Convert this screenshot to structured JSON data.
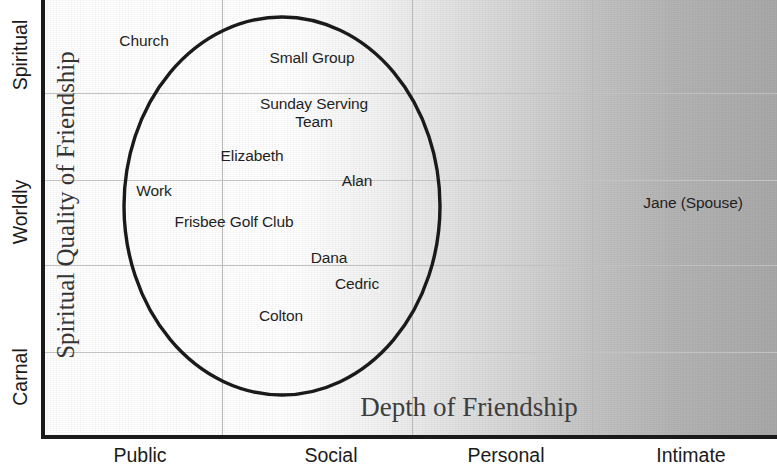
{
  "chart_data": {
    "type": "scatter",
    "title": "",
    "xlabel": "Depth of Friendship",
    "ylabel": "Spiritual Quality of Friendship",
    "x_tick_labels": [
      "Public",
      "Social",
      "Personal",
      "Intimate"
    ],
    "y_tick_labels": [
      "Spiritual",
      "Worldly",
      "Carnal"
    ],
    "grid": true,
    "legend": "none",
    "xlim": [
      0,
      4
    ],
    "ylim": [
      0,
      3
    ],
    "background": {
      "gradient_from": "#ffffff",
      "gradient_to": "#a9a9a9",
      "direction": "left-to-right"
    },
    "annotations": {
      "ellipse": {
        "label": "circle-of-friendship",
        "center_x": 1.33,
        "center_y": 1.58,
        "radius_x": 0.83,
        "radius_y": 1.3,
        "stroke": "#1a1a1a"
      }
    },
    "points": [
      {
        "label": "Church",
        "x": 0.48,
        "y": 2.73,
        "inside_circle": false
      },
      {
        "label": "Small Group",
        "x": 1.38,
        "y": 2.6,
        "inside_circle": true
      },
      {
        "label": "Sunday Serving\nTeam",
        "x": 1.33,
        "y": 2.28,
        "inside_circle": true
      },
      {
        "label": "Elizabeth",
        "x": 1.07,
        "y": 1.92,
        "inside_circle": true
      },
      {
        "label": "Alan",
        "x": 1.71,
        "y": 1.77,
        "inside_circle": true
      },
      {
        "label": "Work",
        "x": 0.59,
        "y": 1.68,
        "inside_circle": true
      },
      {
        "label": "Frisbee Golf Club",
        "x": 1.0,
        "y": 1.47,
        "inside_circle": true
      },
      {
        "label": "Dana",
        "x": 1.5,
        "y": 1.18,
        "inside_circle": true
      },
      {
        "label": "Cedric",
        "x": 1.65,
        "y": 0.99,
        "inside_circle": true
      },
      {
        "label": "Colton",
        "x": 1.23,
        "y": 0.8,
        "inside_circle": true
      },
      {
        "label": "Jane (Spouse)",
        "x": 3.46,
        "y": 1.73,
        "inside_circle": false
      }
    ],
    "gridlines": {
      "vertical_x": [
        1.0,
        2.0,
        3.0
      ],
      "horizontal_y": [
        2.4,
        1.78,
        1.18,
        0.55
      ]
    }
  },
  "labels": {
    "nodes": [
      {
        "text": "Church",
        "px": 100,
        "py": 41
      },
      {
        "text": "Small Group",
        "px": 268,
        "py": 58
      },
      {
        "text": "Sunday Serving\nTeam",
        "px": 270,
        "py": 113
      },
      {
        "text": "Elizabeth",
        "px": 208,
        "py": 156
      },
      {
        "text": "Alan",
        "px": 313,
        "py": 181
      },
      {
        "text": "Work",
        "px": 110,
        "py": 191
      },
      {
        "text": "Frisbee Golf Club",
        "px": 190,
        "py": 222
      },
      {
        "text": "Dana",
        "px": 285,
        "py": 258
      },
      {
        "text": "Cedric",
        "px": 313,
        "py": 284
      },
      {
        "text": "Colton",
        "px": 237,
        "py": 316
      },
      {
        "text": "Jane (Spouse)",
        "px": 649,
        "py": 203
      }
    ],
    "x_ticks": [
      {
        "text": "Public",
        "px": 140
      },
      {
        "text": "Social",
        "px": 331
      },
      {
        "text": "Personal",
        "px": 506
      },
      {
        "text": "Intimate",
        "px": 691
      }
    ],
    "y_ticks": [
      {
        "text": "Spiritual",
        "py": 55
      },
      {
        "text": "Worldly",
        "py": 212
      },
      {
        "text": "Carnal",
        "py": 377
      }
    ],
    "y_axis_title": "Spiritual Quality of Friendship",
    "x_axis_title": "Depth of Friendship"
  },
  "geometry": {
    "gridlines_v_px": [
      178,
      368,
      548
    ],
    "gridlines_h_px": [
      93,
      180,
      265,
      352
    ],
    "ellipse": {
      "cx": 238,
      "cy": 206,
      "rx": 158,
      "ry": 189
    }
  }
}
